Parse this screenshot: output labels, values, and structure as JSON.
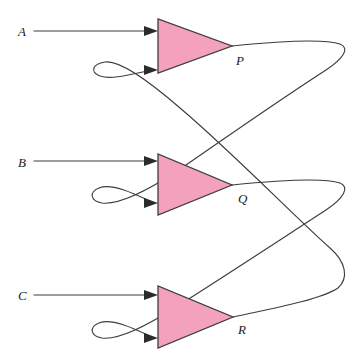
{
  "diagram": {
    "background_color": "#ffffff",
    "wire_color": "#3d3d3d",
    "amplifier_fill": "#f4a1bd",
    "amplifier_stroke": "#3d3d3d",
    "inputs": [
      {
        "id": "A",
        "label": "A",
        "label_x": 18,
        "label_y": 36,
        "line_y": 31
      },
      {
        "id": "B",
        "label": "B",
        "label_x": 18,
        "label_y": 167,
        "line_y": 161
      },
      {
        "id": "C",
        "label": "C",
        "label_x": 18,
        "label_y": 300,
        "line_y": 295
      }
    ],
    "amplifiers": [
      {
        "id": "P",
        "label": "P",
        "label_x": 236,
        "label_y": 65,
        "left_x": 158,
        "top_y": 19,
        "bottom_y": 73,
        "apex_x": 232,
        "apex_y": 46,
        "input_top_y": 31,
        "input_bottom_y": 70
      },
      {
        "id": "Q",
        "label": "Q",
        "label_x": 238,
        "label_y": 203,
        "left_x": 158,
        "top_y": 154,
        "bottom_y": 215,
        "apex_x": 232,
        "apex_y": 185,
        "input_top_y": 161,
        "input_bottom_y": 203
      },
      {
        "id": "R",
        "label": "R",
        "label_x": 238,
        "label_y": 334,
        "left_x": 158,
        "top_y": 286,
        "bottom_y": 348,
        "apex_x": 233,
        "apex_y": 317,
        "input_top_y": 295,
        "input_bottom_y": 338
      }
    ],
    "feedback_loops": [
      {
        "id": "p-output-to-q-lower-input",
        "from": "P",
        "to": "Q",
        "right_extent_x": 341
      },
      {
        "id": "q-output-to-r-lower-input",
        "from": "Q",
        "to": "R",
        "right_extent_x": 341
      },
      {
        "id": "r-output-to-p-lower-input",
        "from": "R",
        "to": "P",
        "right_extent_x": 341
      }
    ]
  }
}
